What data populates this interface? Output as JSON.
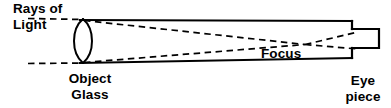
{
  "diagram": {
    "stroke_color": "#000000",
    "background_color": "#ffffff",
    "labels": {
      "rays": "Rays of",
      "light": "Light",
      "object": "Object",
      "glass": "Glass",
      "focus": "Focus",
      "eye": "Eye",
      "piece": "piece"
    },
    "parts": [
      {
        "name": "telescope-tube",
        "label": ""
      },
      {
        "name": "objective-lens",
        "label": "Object Glass"
      },
      {
        "name": "focus-point",
        "label": "Focus"
      },
      {
        "name": "eyepiece",
        "label": "Eye piece"
      },
      {
        "name": "incoming-rays",
        "label": "Rays of Light"
      }
    ],
    "geometry": {
      "tube_left_x": 84,
      "tube_right_x": 352,
      "tube_top_left_y": 20,
      "tube_top_right_y": 21,
      "tube_bottom_left_y": 63,
      "tube_bottom_right_y": 58,
      "lens_center_x": 83,
      "lens_top_y": 19,
      "lens_bottom_y": 63,
      "focus_x": 305,
      "focus_y": 44,
      "eyepiece_x": 352,
      "eyepiece_width": 27,
      "eyepiece_top_y": 29,
      "eyepiece_bottom_y": 48,
      "ray_entry_x": 28
    }
  }
}
